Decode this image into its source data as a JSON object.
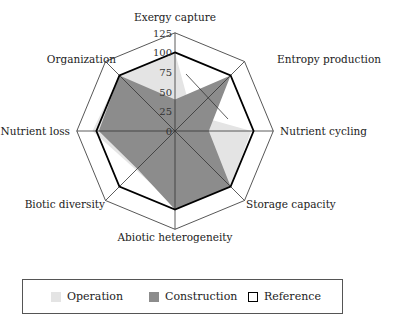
{
  "chart_data": {
    "type": "radar",
    "title": "",
    "categories": [
      "Exergy capture",
      "Entropy production",
      "Nutrient cycling",
      "Storage capacity",
      "Abiotic heterogeneity",
      "Biotic diversity",
      "Nutrient loss",
      "Organization"
    ],
    "rticks": [
      "0",
      "25",
      "50",
      "75",
      "100",
      "125"
    ],
    "rlim": [
      0,
      125
    ],
    "series": [
      {
        "name": "Operation",
        "color": "#e4e4e4",
        "values": [
          100,
          30,
          97,
          100,
          95,
          70,
          105,
          100
        ]
      },
      {
        "name": "Construction",
        "color": "#8c8c8c",
        "values": [
          40,
          100,
          43,
          100,
          100,
          68,
          97,
          100
        ]
      },
      {
        "name": "Reference",
        "color": "#000000",
        "values": [
          100,
          100,
          100,
          100,
          100,
          100,
          100,
          100
        ]
      }
    ],
    "legend_position": "bottom"
  },
  "legend": {
    "operation": "Operation",
    "construction": "Construction",
    "reference": "Reference"
  }
}
